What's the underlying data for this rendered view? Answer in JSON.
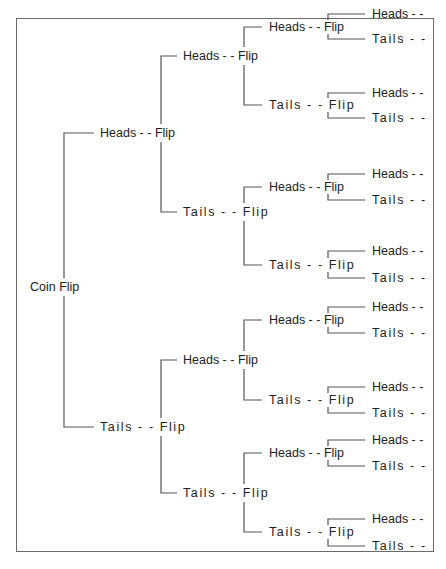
{
  "diagram": {
    "type": "decision-tree",
    "root": {
      "label": "Coin Flip"
    },
    "level1": [
      {
        "label": "Heads - - Flip"
      },
      {
        "label": "Tails - - Flip"
      }
    ],
    "level2": [
      {
        "label": "Heads - - Flip"
      },
      {
        "label": "Tails - - Flip"
      },
      {
        "label": "Heads - - Flip"
      },
      {
        "label": "Tails - - Flip"
      }
    ],
    "level3": [
      {
        "label": "Heads - - Flip"
      },
      {
        "label": "Tails - - Flip"
      },
      {
        "label": "Heads - - Flip"
      },
      {
        "label": "Tails - - Flip"
      },
      {
        "label": "Heads - - Flip"
      },
      {
        "label": "Tails - - Flip"
      },
      {
        "label": "Heads - - Flip"
      },
      {
        "label": "Tails - - Flip"
      }
    ],
    "leaves": [
      {
        "label": "Heads - -"
      },
      {
        "label": "Tails - -"
      },
      {
        "label": "Heads - -"
      },
      {
        "label": "Tails - -"
      },
      {
        "label": "Heads - -"
      },
      {
        "label": "Tails - -"
      },
      {
        "label": "Heads - -"
      },
      {
        "label": "Tails - -"
      },
      {
        "label": "Heads - -"
      },
      {
        "label": "Tails - -"
      },
      {
        "label": "Heads - -"
      },
      {
        "label": "Tails - -"
      },
      {
        "label": "Heads - -"
      },
      {
        "label": "Tails - -"
      },
      {
        "label": "Heads - -"
      },
      {
        "label": "Tails - -"
      }
    ],
    "colors": {
      "line": "#555555",
      "text": "#222222",
      "border": "#6a6a6a"
    }
  }
}
